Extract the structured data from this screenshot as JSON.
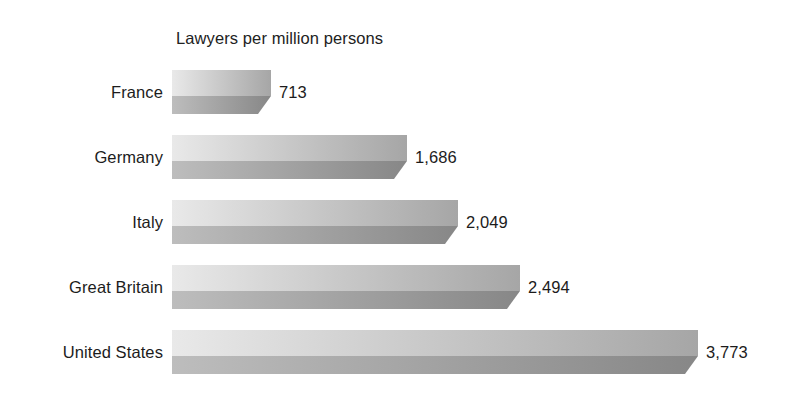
{
  "chart_data": {
    "type": "bar",
    "orientation": "horizontal",
    "title": "Lawyers per million persons",
    "xlabel": "",
    "ylabel": "",
    "categories": [
      "France",
      "Germany",
      "Italy",
      "Great Britain",
      "United States"
    ],
    "values": [
      713,
      1686,
      2049,
      2494,
      3773
    ],
    "value_labels": [
      "713",
      "1,686",
      "2,049",
      "2,494",
      "3,773"
    ],
    "xlim": [
      0,
      3773
    ],
    "grid": false,
    "legend": false,
    "axis_visible": false,
    "style": {
      "bar_top_face_light": "#e9e9e9",
      "bar_top_face_dark": "#a6a6a6",
      "bar_bottom_face_light": "#bdbdbd",
      "bar_bottom_face_dark": "#878787",
      "bar_edge": "#7d7d7d",
      "background": "#ffffff",
      "text": "#1c1c1c"
    }
  }
}
